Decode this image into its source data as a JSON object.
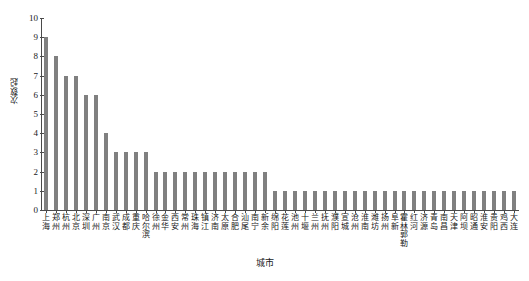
{
  "chart_data": {
    "type": "bar",
    "title": "",
    "xlabel": "城市",
    "ylabel": "次数/起",
    "ylim": [
      0,
      10
    ],
    "yticks": [
      0,
      1,
      2,
      3,
      4,
      5,
      6,
      7,
      8,
      9,
      10
    ],
    "grid": false,
    "legend": null,
    "bar_color": "#808080",
    "axis_color": "#4a4a4a",
    "categories": [
      "上海",
      "郑州",
      "杭州",
      "北京",
      "深圳",
      "广州",
      "南京",
      "武汉",
      "成都",
      "重庆",
      "哈尔滨",
      "徐州",
      "金华",
      "西安",
      "常州",
      "珠海",
      "镇江",
      "济南",
      "太原",
      "合肥",
      "汕尾",
      "南宁",
      "新余",
      "绵阳",
      "花莲",
      "池州",
      "十堰",
      "兰州",
      "抚州",
      "濮阳",
      "宣城",
      "沧州",
      "淮南",
      "潍坊",
      "扬州",
      "阜新",
      "霍林郭勒",
      "红河",
      "济源",
      "青岛",
      "南昌",
      "天津",
      "阿坝",
      "昭通",
      "淮安",
      "贵阳",
      "鸡西",
      "大连"
    ],
    "values": [
      9,
      8,
      7,
      7,
      6,
      6,
      4,
      3,
      3,
      3,
      3,
      2,
      2,
      2,
      2,
      2,
      2,
      2,
      2,
      2,
      2,
      2,
      2,
      1,
      1,
      1,
      1,
      1,
      1,
      1,
      1,
      1,
      1,
      1,
      1,
      1,
      1,
      1,
      1,
      1,
      1,
      1,
      1,
      1,
      1,
      1,
      1,
      1
    ]
  }
}
